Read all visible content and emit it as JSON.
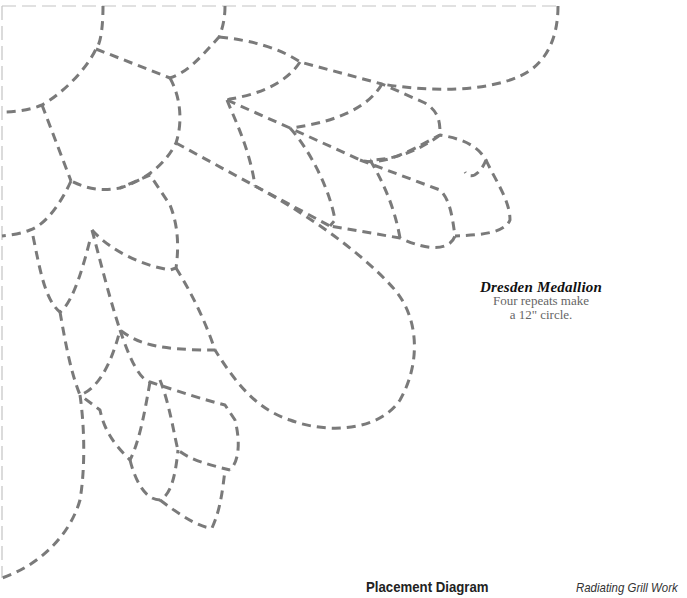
{
  "diagram": {
    "type": "quilting-stencil-placement",
    "stitch_color": "#7a7a7a",
    "frame_color": "#c4c4c4",
    "background": "#ffffff"
  },
  "caption": {
    "title": "Dresden Medallion",
    "line1": "Four repeats make",
    "line2": "a 12\" circle."
  },
  "footer": {
    "title": "Placement Diagram",
    "subtitle": "Radiating Grill Work"
  }
}
